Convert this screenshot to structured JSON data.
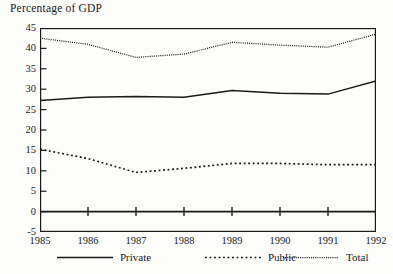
{
  "chart_data": {
    "type": "line",
    "title": "Percentage of GDP",
    "xlabel": "",
    "ylabel": "",
    "x": [
      1985,
      1986,
      1987,
      1988,
      1989,
      1990,
      1991,
      1992
    ],
    "categories": [
      "1985",
      "1986",
      "1987",
      "1988",
      "1989",
      "1990",
      "1991",
      "1992"
    ],
    "series": [
      {
        "name": "Private",
        "style": "solid",
        "values": [
          27.2,
          28.0,
          28.2,
          28.0,
          29.7,
          29.0,
          28.8,
          32.0
        ]
      },
      {
        "name": "Public",
        "style": "dotted",
        "values": [
          15.3,
          13.0,
          9.6,
          10.6,
          11.8,
          11.8,
          11.5,
          11.5
        ]
      },
      {
        "name": "Total",
        "style": "fine-dotted",
        "values": [
          42.5,
          41.0,
          37.8,
          38.6,
          41.5,
          40.8,
          40.3,
          43.5
        ]
      }
    ],
    "ylim": [
      -5,
      45
    ],
    "yticks": [
      -5,
      0,
      5,
      10,
      15,
      20,
      25,
      30,
      35,
      40,
      45
    ],
    "ytick_labels": [
      "-5",
      "0",
      "5",
      "10",
      "15",
      "20",
      "25",
      "30",
      "35",
      "40",
      "45"
    ],
    "xlim": [
      1985,
      1992
    ],
    "grid": false,
    "zero_line": 0,
    "legend_position": "bottom",
    "line_color": "#1a1a1a",
    "background_color": "#fdfdfb"
  },
  "legend": {
    "items": [
      {
        "label": "Private",
        "style": "solid"
      },
      {
        "label": "Public",
        "style": "dotted"
      },
      {
        "label": "Total",
        "style": "fine-dotted"
      }
    ]
  }
}
